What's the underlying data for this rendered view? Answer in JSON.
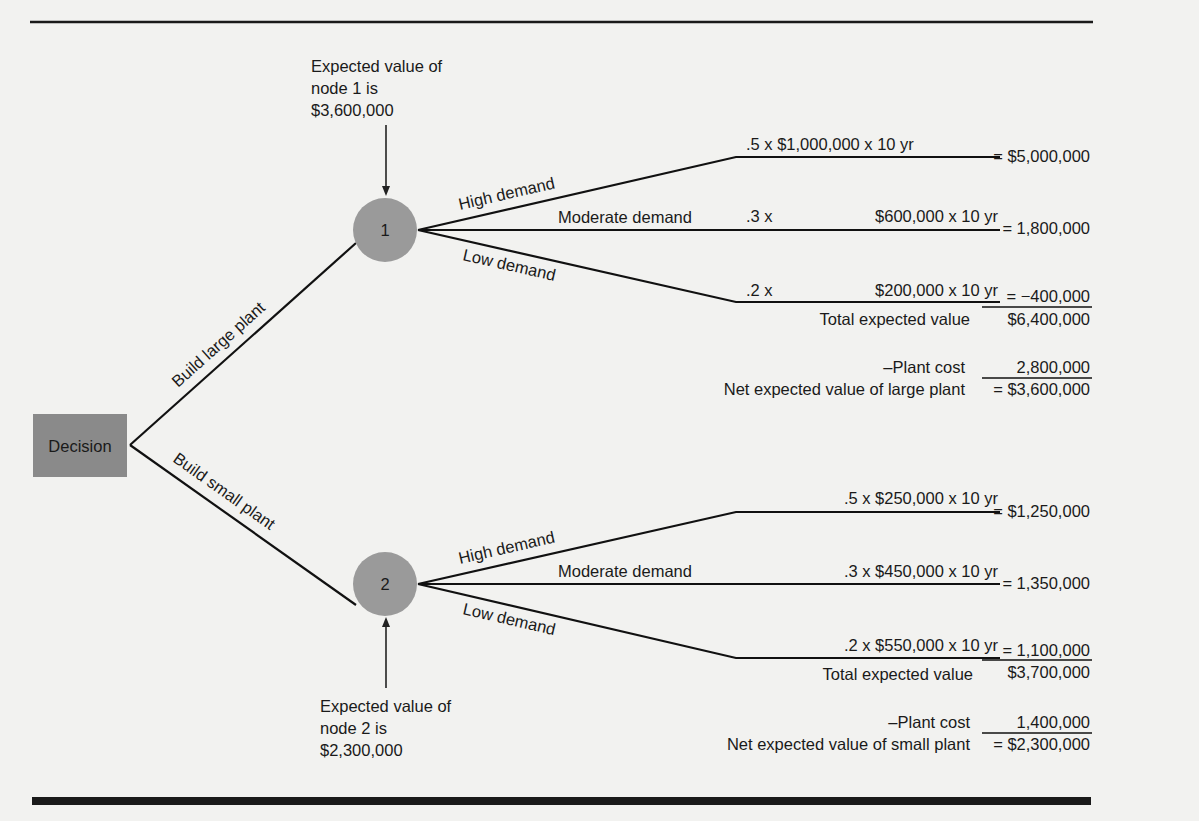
{
  "decision_node": {
    "label": "Decision",
    "fill": "#8a8a8a"
  },
  "branches": {
    "large": "Build large plant",
    "small": "Build small plant"
  },
  "node1": {
    "label": "1",
    "annotation": [
      "Expected value of",
      "node 1 is",
      "$3,600,000"
    ],
    "outcomes": [
      {
        "name": "High demand",
        "formula": ".5 x $1,000,000 x 10 yr",
        "value": "= $5,000,000"
      },
      {
        "name": "Moderate demand",
        "formula_prefix": ".3 x",
        "formula": "$600,000 x 10 yr",
        "value": "=   1,800,000"
      },
      {
        "name": "Low demand",
        "formula_prefix": ".2 x",
        "formula": "$200,000 x 10 yr",
        "value": "=    −400,000"
      }
    ],
    "total_label": "Total expected value",
    "total_value": "$6,400,000",
    "cost_label": "–Plant cost",
    "cost_value": "2,800,000",
    "net_label": "Net expected value of large plant",
    "net_value": "= $3,600,000"
  },
  "node2": {
    "label": "2",
    "annotation": [
      "Expected value of",
      "node 2 is",
      "$2,300,000"
    ],
    "outcomes": [
      {
        "name": "High demand",
        "formula": ".5 x $250,000 x 10 yr",
        "value": "= $1,250,000"
      },
      {
        "name": "Moderate demand",
        "formula": ".3 x $450,000 x 10 yr",
        "value": "=   1,350,000"
      },
      {
        "name": "Low demand",
        "formula": ".2 x $550,000 x 10 yr",
        "value": "=   1,100,000"
      }
    ],
    "total_label": "Total expected value",
    "total_value": "$3,700,000",
    "cost_label": "–Plant cost",
    "cost_value": "1,400,000",
    "net_label": "Net expected value of small plant",
    "net_value": "= $2,300,000"
  }
}
